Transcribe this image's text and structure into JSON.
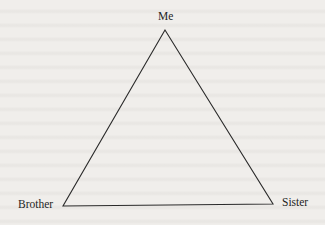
{
  "diagram": {
    "type": "triangle",
    "nodes": {
      "top": {
        "label": "Me"
      },
      "bottom_left": {
        "label": "Brother"
      },
      "bottom_right": {
        "label": "Sister"
      }
    },
    "edges": [
      [
        "Me",
        "Brother"
      ],
      [
        "Me",
        "Sister"
      ],
      [
        "Brother",
        "Sister"
      ]
    ],
    "colors": {
      "line": "#2a2a2a",
      "background": "#f0eeeb",
      "text": "#1e1e1e"
    }
  }
}
